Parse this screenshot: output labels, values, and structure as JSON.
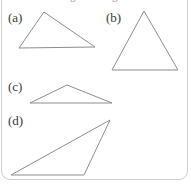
{
  "panel": {
    "background_color": "#ffffff",
    "border_color": "#cfcfcf",
    "clipped_header_text": "congruent figures"
  },
  "style": {
    "stroke_color": "#8d8d8d",
    "stroke_width": 1,
    "label_color": "#3a3a3a"
  },
  "figures": [
    {
      "label": "(a)",
      "label_x": 8,
      "label_y": 11,
      "shape": "triangle",
      "points": "44,12 95,47 19,48 44,12"
    },
    {
      "label": "(b)",
      "label_x": 106,
      "label_y": 11,
      "shape": "triangle",
      "points": "144,11 178,70 112,70 144,11"
    },
    {
      "label": "(c)",
      "label_x": 8,
      "label_y": 80,
      "shape": "triangle",
      "points": "67,85 112,103 30,103 67,85"
    },
    {
      "label": "(d)",
      "label_x": 8,
      "label_y": 114,
      "shape": "triangle",
      "points": "110,120 84,175 11,175 110,120"
    }
  ]
}
